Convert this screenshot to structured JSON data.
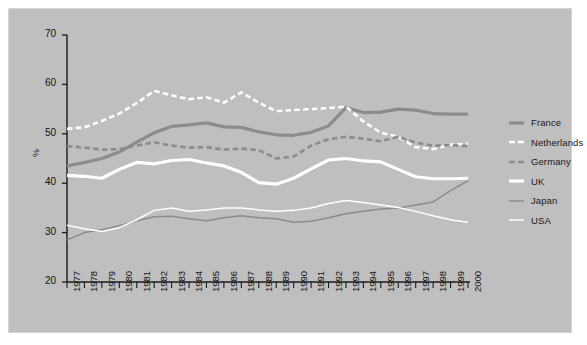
{
  "chart_data": {
    "type": "line",
    "title": "",
    "subtitle": "",
    "xlabel": "",
    "ylabel": "%",
    "xlim": [
      1977,
      2000
    ],
    "ylim": [
      20,
      70
    ],
    "yticks": [
      20,
      30,
      40,
      50,
      60,
      70
    ],
    "grid": false,
    "legend_position": "right",
    "background_color": "#bfbfbf",
    "axis_color": "#1a1a1a",
    "x": [
      1977,
      1978,
      1979,
      1980,
      1981,
      1982,
      1983,
      1984,
      1985,
      1986,
      1987,
      1988,
      1989,
      1990,
      1991,
      1992,
      1993,
      1994,
      1995,
      1996,
      1997,
      1998,
      1999,
      2000
    ],
    "categories": [
      "1977",
      "1978",
      "1979",
      "1980",
      "1981",
      "1982",
      "1983",
      "1984",
      "1985",
      "1986",
      "1987",
      "1988",
      "1989",
      "1990",
      "1991",
      "1992",
      "1993",
      "1994",
      "1995",
      "1996",
      "1997",
      "1998",
      "1999",
      "2000"
    ],
    "series": [
      {
        "name": "France",
        "color": "#8c8c8c",
        "style": "solid",
        "width": 3.2,
        "values": [
          43.5,
          44.2,
          45.0,
          46.3,
          48.3,
          50.2,
          51.5,
          51.8,
          52.2,
          51.4,
          51.3,
          50.4,
          49.8,
          49.7,
          50.3,
          51.6,
          55.3,
          54.3,
          54.4,
          55.0,
          54.8,
          54.1,
          54.0,
          54.0
        ]
      },
      {
        "name": "Netherlands",
        "color": "#ffffff",
        "style": "dashed",
        "width": 2.6,
        "values": [
          51.0,
          51.3,
          52.6,
          54.1,
          56.2,
          58.7,
          57.8,
          57.0,
          57.4,
          56.3,
          58.4,
          56.3,
          54.6,
          54.8,
          55.0,
          55.2,
          55.5,
          52.5,
          50.2,
          49.4,
          47.3,
          46.9,
          47.8,
          48.0
        ]
      },
      {
        "name": "Germany",
        "color": "#8c8c8c",
        "style": "dashed",
        "width": 2.6,
        "values": [
          47.5,
          47.2,
          46.8,
          46.9,
          47.6,
          48.3,
          47.6,
          47.2,
          47.3,
          46.8,
          47.0,
          46.7,
          45.0,
          45.4,
          47.6,
          48.9,
          49.4,
          49.0,
          48.5,
          49.4,
          48.2,
          47.6,
          47.7,
          47.5
        ]
      },
      {
        "name": "UK",
        "color": "#ffffff",
        "style": "solid",
        "width": 3.2,
        "values": [
          41.6,
          41.4,
          41.0,
          42.8,
          44.2,
          43.9,
          44.6,
          44.8,
          44.1,
          43.5,
          42.2,
          40.1,
          39.8,
          41.0,
          42.9,
          44.7,
          45.0,
          44.5,
          44.3,
          42.8,
          41.3,
          40.9,
          40.9,
          41.0
        ]
      },
      {
        "name": "Japan",
        "color": "#8c8c8c",
        "style": "solid",
        "width": 1.5,
        "values": [
          28.5,
          30.0,
          30.6,
          31.4,
          32.4,
          33.2,
          33.3,
          32.8,
          32.4,
          33.0,
          33.4,
          33.0,
          32.8,
          32.1,
          32.3,
          33.0,
          33.8,
          34.3,
          34.8,
          35.0,
          35.6,
          36.2,
          38.5,
          40.5
        ]
      },
      {
        "name": "USA",
        "color": "#ffffff",
        "style": "solid",
        "width": 1.5,
        "values": [
          31.5,
          30.8,
          30.2,
          31.0,
          32.6,
          34.5,
          35.0,
          34.3,
          34.6,
          35.0,
          35.0,
          34.6,
          34.3,
          34.5,
          35.0,
          35.9,
          36.5,
          36.1,
          35.6,
          35.1,
          34.3,
          33.4,
          32.6,
          32.1
        ]
      }
    ]
  },
  "legend": {
    "items": [
      {
        "label": "France"
      },
      {
        "label": "Netherlands"
      },
      {
        "label": "Germany"
      },
      {
        "label": "UK"
      },
      {
        "label": "Japan"
      },
      {
        "label": "USA"
      }
    ]
  }
}
